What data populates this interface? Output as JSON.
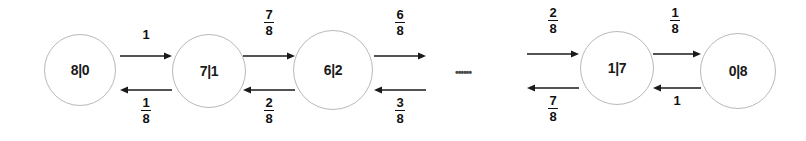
{
  "diagram": {
    "background_color": "#ffffff",
    "node_stroke_color": "#b9b9b9",
    "arrow_color": "#1a1a1a",
    "text_color": "#111111",
    "ellipsis": "••••••",
    "nodes": [
      {
        "id": "n0",
        "label": "8|0",
        "cx": 80,
        "cy": 70,
        "r": 36
      },
      {
        "id": "n1",
        "label": "7|1",
        "cx": 209,
        "cy": 71,
        "r": 37
      },
      {
        "id": "n2",
        "label": "6|2",
        "cx": 333,
        "cy": 70,
        "r": 40
      },
      {
        "id": "n3",
        "label": "1|7",
        "cx": 617,
        "cy": 68,
        "r": 37
      },
      {
        "id": "n4",
        "label": "0|8",
        "cx": 738,
        "cy": 71,
        "r": 38
      }
    ],
    "edges": [
      {
        "id": "e0f",
        "from": "8|0",
        "to": "7|1",
        "direction": "forward",
        "type": "whole",
        "label": "1",
        "numerator": "1",
        "denominator": ""
      },
      {
        "id": "e0b",
        "from": "7|1",
        "to": "8|0",
        "direction": "backward",
        "type": "fraction",
        "label": "1/8",
        "numerator": "1",
        "denominator": "8"
      },
      {
        "id": "e1f",
        "from": "7|1",
        "to": "6|2",
        "direction": "forward",
        "type": "fraction",
        "label": "7/8",
        "numerator": "7",
        "denominator": "8"
      },
      {
        "id": "e1b",
        "from": "6|2",
        "to": "7|1",
        "direction": "backward",
        "type": "fraction",
        "label": "2/8",
        "numerator": "2",
        "denominator": "8"
      },
      {
        "id": "e2f",
        "from": "6|2",
        "to": "...",
        "direction": "forward",
        "type": "fraction",
        "label": "6/8",
        "numerator": "6",
        "denominator": "8"
      },
      {
        "id": "e2b",
        "from": "...",
        "to": "6|2",
        "direction": "backward",
        "type": "fraction",
        "label": "3/8",
        "numerator": "3",
        "denominator": "8"
      },
      {
        "id": "e3f",
        "from": "...",
        "to": "1|7",
        "direction": "forward",
        "type": "fraction",
        "label": "2/8",
        "numerator": "2",
        "denominator": "8"
      },
      {
        "id": "e3b",
        "from": "1|7",
        "to": "...",
        "direction": "backward",
        "type": "fraction",
        "label": "7/8",
        "numerator": "7",
        "denominator": "8"
      },
      {
        "id": "e4f",
        "from": "1|7",
        "to": "0|8",
        "direction": "forward",
        "type": "fraction",
        "label": "1/8",
        "numerator": "1",
        "denominator": "8"
      },
      {
        "id": "e4b",
        "from": "0|8",
        "to": "1|7",
        "direction": "backward",
        "type": "whole",
        "label": "1",
        "numerator": "1",
        "denominator": ""
      }
    ]
  }
}
